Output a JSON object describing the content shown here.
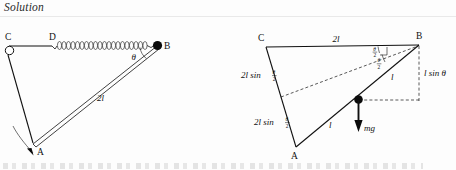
{
  "page": {
    "heading": "Solution",
    "background_color": "#fdfdfd",
    "ink_color": "#111111"
  },
  "figures": [
    {
      "id": "left-figure",
      "name": "spring-rod-mechanism",
      "points": [
        {
          "label": "C",
          "kind": "open-pivot"
        },
        {
          "label": "D",
          "kind": "spring-anchor"
        },
        {
          "label": "B",
          "kind": "filled-ball"
        },
        {
          "label": "A",
          "kind": "joint"
        }
      ],
      "labels": {
        "c": "C",
        "d": "D",
        "b": "B",
        "a": "A",
        "theta": "θ",
        "rod_length": "2l"
      },
      "elements": {
        "spring": "coil-spring",
        "motion_arrow": "curved-arrow-down-left"
      }
    },
    {
      "id": "right-figure",
      "name": "geometry-triangle-diagram",
      "points": [
        {
          "label": "C",
          "kind": "vertex"
        },
        {
          "label": "B",
          "kind": "vertex"
        },
        {
          "label": "A",
          "kind": "vertex"
        },
        {
          "label": "",
          "kind": "center-of-mass-dot"
        }
      ],
      "labels": {
        "c": "C",
        "b": "B",
        "a": "A",
        "top_side": "2l",
        "upper_left_side_num": "θ",
        "upper_left_side_den": "2",
        "upper_left_side_prefix": "2l sin",
        "lower_left_side_prefix": "2l sin",
        "lower_left_side_num": "θ",
        "lower_left_side_den": "2",
        "angle_upper_num": "θ",
        "angle_upper_den": "2",
        "angle_lower_num": "θ",
        "angle_lower_den": "2",
        "seg_upper": "l",
        "seg_lower": "l",
        "vertical_drop": "l sin θ",
        "weight": "mg"
      },
      "elements": {
        "dashed_median": "dashed-line-midpoint-to-B",
        "dashed_vertical": "dashed-vertical-drop-from-B",
        "dashed_horizontal": "dashed-horizontal-from-mass",
        "weight_arrow": "downward-force-arrow",
        "right_angle_mark": "right-angle-tick"
      }
    }
  ]
}
